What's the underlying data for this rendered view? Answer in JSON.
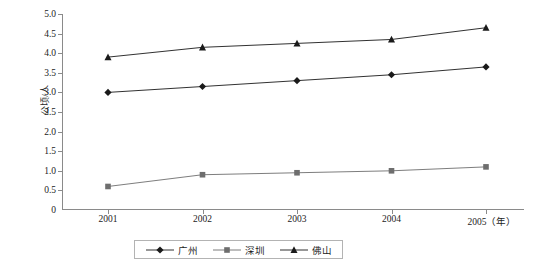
{
  "chart_data": {
    "type": "line",
    "title": "",
    "xlabel": "年",
    "ylabel": "公顷/人",
    "x": [
      "2001",
      "2002",
      "2003",
      "2004",
      "2005"
    ],
    "categories": [
      "2001",
      "2002",
      "2003",
      "2004",
      "2005"
    ],
    "xlim": [
      2001,
      2005
    ],
    "ylim": [
      0,
      5.0
    ],
    "yticks": [
      0,
      0.5,
      1.0,
      1.5,
      2.0,
      2.5,
      3.0,
      3.5,
      4.0,
      4.5,
      5.0
    ],
    "ytick_labels": [
      "0",
      "0.5",
      "1.0",
      "1.5",
      "2.0",
      "2.5",
      "3.0",
      "3.5",
      "4.0",
      "4.5",
      "5.0"
    ],
    "grid": false,
    "legend_position": "bottom",
    "series": [
      {
        "name": "广州",
        "marker": "diamond",
        "color": "#1a1a1a",
        "values": [
          3.0,
          3.15,
          3.3,
          3.45,
          3.65
        ]
      },
      {
        "name": "深圳",
        "marker": "square",
        "color": "#6e6e6e",
        "values": [
          0.6,
          0.9,
          0.95,
          1.0,
          1.1
        ]
      },
      {
        "name": "佛山",
        "marker": "triangle",
        "color": "#1a1a1a",
        "values": [
          3.9,
          4.15,
          4.25,
          4.35,
          4.65
        ]
      }
    ]
  },
  "axes": {
    "y_title": "公顷/人",
    "x_unit": "（年）"
  },
  "legend": {
    "items": [
      {
        "label": "广州",
        "marker": "diamond-marker-icon"
      },
      {
        "label": "深圳",
        "marker": "square-marker-icon"
      },
      {
        "label": "佛山",
        "marker": "triangle-marker-icon"
      }
    ]
  }
}
